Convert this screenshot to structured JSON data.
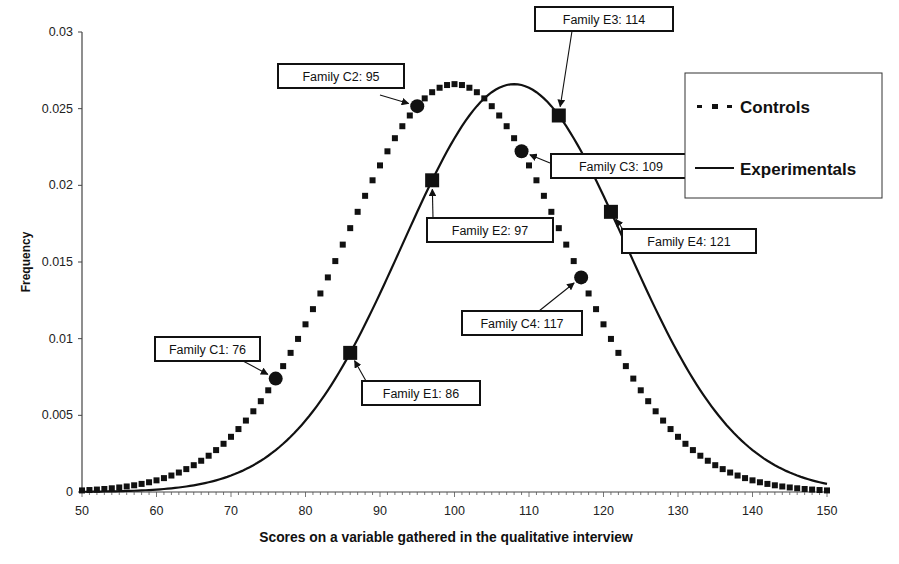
{
  "chart_data": {
    "type": "line",
    "title": "",
    "xlabel": "Scores on a variable gathered in the qualitative interview",
    "ylabel": "Frequency",
    "xlim": [
      50,
      150
    ],
    "ylim": [
      0,
      0.03
    ],
    "x_ticks": [
      50,
      60,
      70,
      80,
      90,
      100,
      110,
      120,
      130,
      140,
      150
    ],
    "y_ticks": [
      0,
      0.005,
      0.01,
      0.015,
      0.02,
      0.025,
      0.03
    ],
    "y_tick_labels": [
      "0",
      "0.005",
      "0.01",
      "0.015",
      "0.02",
      "0.025",
      "0.03"
    ],
    "grid": false,
    "legend_position": "top-right",
    "series": [
      {
        "name": "Controls",
        "style": "dotted-square-markers",
        "distribution": "normal",
        "mean": 100,
        "sd": 15,
        "peak": 0.0266,
        "x": [
          50,
          60,
          70,
          76,
          80,
          86,
          90,
          95,
          100,
          105,
          109,
          110,
          117,
          120,
          130,
          140,
          150
        ],
        "values": [
          0.0001,
          0.0011,
          0.0036,
          0.0074,
          0.0109,
          0.0172,
          0.0213,
          0.0252,
          0.0266,
          0.0252,
          0.0222,
          0.0213,
          0.0139,
          0.0109,
          0.0036,
          0.0011,
          0.0001
        ]
      },
      {
        "name": "Experimentals",
        "style": "solid-line",
        "distribution": "normal",
        "mean": 108,
        "sd": 15,
        "peak": 0.0266,
        "x": [
          50,
          60,
          70,
          80,
          86,
          90,
          97,
          100,
          108,
          114,
          120,
          121,
          130,
          140,
          150
        ],
        "values": [
          0.0,
          0.0002,
          0.0011,
          0.0046,
          0.0091,
          0.0131,
          0.0202,
          0.0229,
          0.0266,
          0.0244,
          0.0192,
          0.0183,
          0.009,
          0.0027,
          0.0005
        ]
      }
    ],
    "annotations": [
      {
        "label": "Family C1: 76",
        "series": "Controls",
        "x": 76,
        "y": 0.0074,
        "marker": "circle"
      },
      {
        "label": "Family C2: 95",
        "series": "Controls",
        "x": 95,
        "y": 0.0252,
        "marker": "circle"
      },
      {
        "label": "Family C3: 109",
        "series": "Controls",
        "x": 109,
        "y": 0.0222,
        "marker": "circle"
      },
      {
        "label": "Family C4: 117",
        "series": "Controls",
        "x": 117,
        "y": 0.0139,
        "marker": "circle"
      },
      {
        "label": "Family E1: 86",
        "series": "Experimentals",
        "x": 86,
        "y": 0.0091,
        "marker": "square"
      },
      {
        "label": "Family E2: 97",
        "series": "Experimentals",
        "x": 97,
        "y": 0.0202,
        "marker": "square"
      },
      {
        "label": "Family E3: 114",
        "series": "Experimentals",
        "x": 114,
        "y": 0.0244,
        "marker": "square"
      },
      {
        "label": "Family E4: 121",
        "series": "Experimentals",
        "x": 121,
        "y": 0.0183,
        "marker": "square"
      }
    ]
  },
  "layout": {
    "plot": {
      "x0": 82,
      "x1": 827,
      "y0": 492,
      "y1": 32
    },
    "label_boxes": [
      {
        "x": 278,
        "y": 64,
        "w": 126,
        "h": 24,
        "ax1": 380,
        "ay1": 95,
        "ax2": 405,
        "ay2": 108
      },
      {
        "x": 535,
        "y": 7,
        "w": 138,
        "h": 24,
        "ax1": 572,
        "ay1": 31,
        "ax2": 556,
        "ay2": 108
      },
      {
        "x": 551,
        "y": 154,
        "w": 140,
        "h": 24,
        "ax1": 550,
        "ay1": 163,
        "ax2": 521,
        "ay2": 156
      },
      {
        "x": 622,
        "y": 229,
        "w": 134,
        "h": 24,
        "ax1": 624,
        "ay1": 231,
        "ax2": 607,
        "ay2": 220
      },
      {
        "x": 427,
        "y": 218,
        "w": 126,
        "h": 24,
        "ax1": 433,
        "ay1": 218,
        "ax2": 428,
        "ay2": 188
      },
      {
        "x": 155,
        "y": 337,
        "w": 105,
        "h": 24,
        "ax1": 243,
        "ay1": 361,
        "ax2": 269,
        "ay2": 378
      },
      {
        "x": 362,
        "y": 381,
        "w": 118,
        "h": 24,
        "ax1": 366,
        "ay1": 381,
        "ax2": 353,
        "ay2": 366
      },
      {
        "x": 462,
        "y": 311,
        "w": 120,
        "h": 24,
        "ax1": 539,
        "ay1": 311,
        "ax2": 568,
        "ay2": 283
      }
    ],
    "legend": {
      "x": 685,
      "y": 73,
      "w": 197,
      "h": 125
    }
  },
  "legend": {
    "items": [
      {
        "label": "Controls"
      },
      {
        "label": "Experimentals"
      }
    ]
  },
  "colors": {
    "ink": "#111111",
    "axis": "#444444",
    "background": "#ffffff"
  }
}
